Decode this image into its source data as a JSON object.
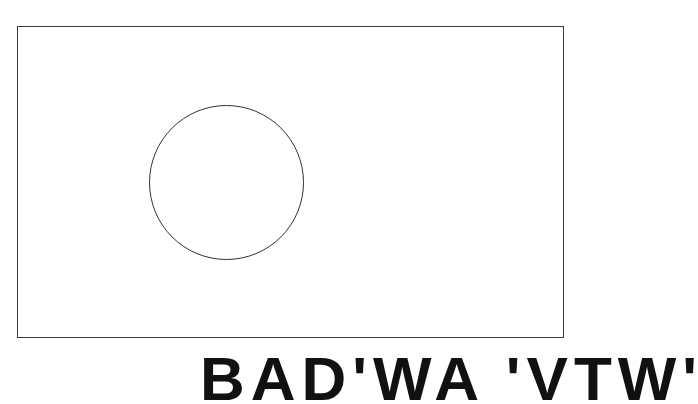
{
  "figure": {
    "type": "flag-outline",
    "border_color": "#3a3a3a",
    "circle_color": "#333333"
  },
  "caption": {
    "text": "BAD'WA 'VTW'"
  }
}
